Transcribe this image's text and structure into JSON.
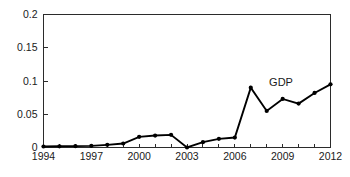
{
  "chart_data": {
    "type": "line",
    "title": "",
    "subtitle": "",
    "xlabel": "",
    "ylabel": "",
    "xlim": [
      1994,
      2012
    ],
    "ylim": [
      0,
      0.2
    ],
    "grid": false,
    "legend_position": "inline-annotation",
    "x": [
      1994,
      1995,
      1996,
      1997,
      1998,
      1999,
      2000,
      2001,
      2002,
      2003,
      2004,
      2005,
      2006,
      2007,
      2008,
      2009,
      2010,
      2011,
      2012
    ],
    "series": [
      {
        "name": "GDP",
        "annotation": "GDP",
        "color": "#000000",
        "marker": "filled-circle",
        "values": [
          0.0015,
          0.0018,
          0.002,
          0.0025,
          0.004,
          0.006,
          0.016,
          0.018,
          0.019,
          0.0,
          0.008,
          0.013,
          0.015,
          0.09,
          0.055,
          0.073,
          0.066,
          0.082,
          0.095
        ]
      }
    ],
    "x_tick_values": [
      1994,
      1995,
      1996,
      1997,
      1998,
      1999,
      2000,
      2001,
      2002,
      2003,
      2004,
      2005,
      2006,
      2007,
      2008,
      2009,
      2010,
      2011,
      2012
    ],
    "x_tick_labels": [
      "1994",
      "",
      "",
      "1997",
      "",
      "",
      "2000",
      "",
      "",
      "2003",
      "",
      "",
      "2006",
      "",
      "",
      "2009",
      "",
      "",
      "2012"
    ],
    "y_tick_values": [
      0,
      0.05,
      0.1,
      0.15,
      0.2
    ],
    "y_tick_labels": [
      "0",
      "0.05",
      "0.1",
      "0.15",
      "0.2"
    ],
    "axis_color": "#2b2b2b",
    "background_color": "#ffffff"
  },
  "annotations": {
    "gdp_label": "GDP"
  }
}
